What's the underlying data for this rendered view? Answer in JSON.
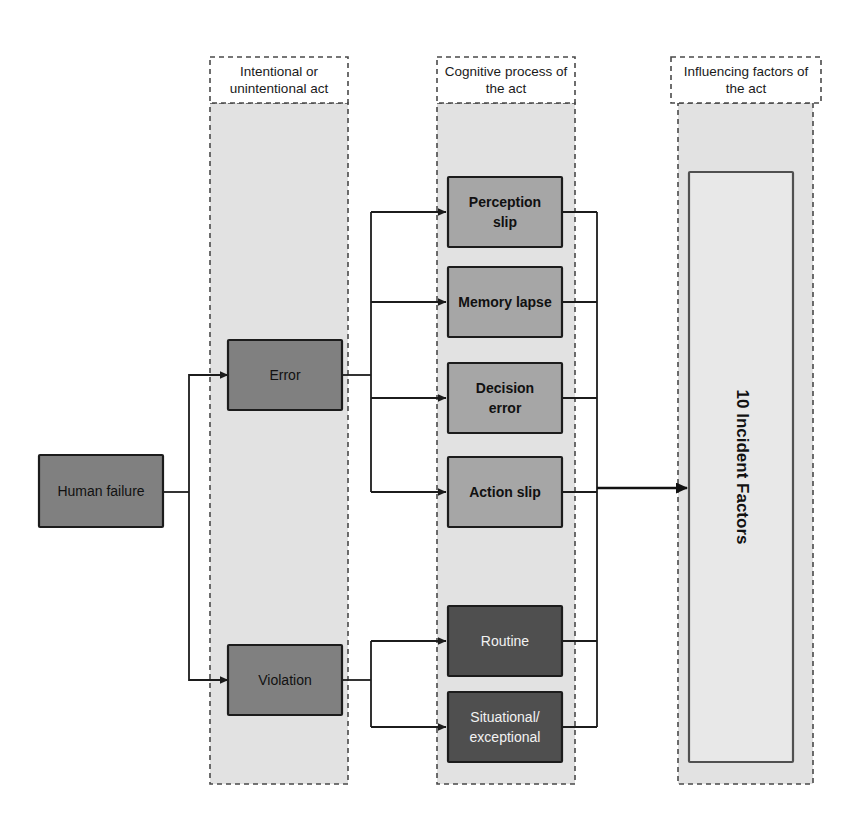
{
  "diagram": {
    "background_color": "#ffffff",
    "columns": [
      {
        "id": "act",
        "header": "Intentional or\nunintentional act",
        "header_line1": "Intentional or",
        "header_line2": "unintentional act"
      },
      {
        "id": "cognitive",
        "header": "Cognitive process of\nthe act",
        "header_line1": "Cognitive process of",
        "header_line2": "the act"
      },
      {
        "id": "influencing",
        "header": "Influencing factors of\nthe act",
        "header_line1": "Influencing factors of",
        "header_line2": "the act"
      }
    ],
    "source_node": {
      "label": "Human failure",
      "fill": "#808080",
      "text_color": "#111111"
    },
    "act_nodes": [
      {
        "label": "Error",
        "fill": "#808080",
        "text_color": "#111111"
      },
      {
        "label": "Violation",
        "fill": "#808080",
        "text_color": "#111111"
      }
    ],
    "cognitive_nodes": [
      {
        "label": "Perception slip",
        "line1": "Perception",
        "line2": "slip",
        "fill": "#a6a6a6",
        "text_color": "#111111",
        "parent": "Error"
      },
      {
        "label": "Memory lapse",
        "line1": "Memory lapse",
        "line2": "",
        "fill": "#a6a6a6",
        "text_color": "#111111",
        "parent": "Error"
      },
      {
        "label": "Decision error",
        "line1": "Decision",
        "line2": "error",
        "fill": "#a6a6a6",
        "text_color": "#111111",
        "parent": "Error"
      },
      {
        "label": "Action slip",
        "line1": "Action slip",
        "line2": "",
        "fill": "#a6a6a6",
        "text_color": "#111111",
        "parent": "Error"
      },
      {
        "label": "Routine",
        "line1": "Routine",
        "line2": "",
        "fill": "#4f4f4f",
        "text_color": "#f2f2f2",
        "parent": "Violation"
      },
      {
        "label": "Situational/ exceptional",
        "line1": "Situational/",
        "line2": "exceptional",
        "fill": "#4f4f4f",
        "text_color": "#f2f2f2",
        "parent": "Violation"
      }
    ],
    "outcome_node": {
      "label": "10 Incident Factors",
      "fill": "#e8e8e8",
      "text_color": "#111111",
      "orientation": "vertical"
    },
    "colors": {
      "band_fill": "#e2e2e2",
      "band_stroke": "#4a4a4a",
      "node_stroke": "#1c1c1c",
      "connector": "#1c1c1c",
      "page": "#ffffff"
    }
  }
}
